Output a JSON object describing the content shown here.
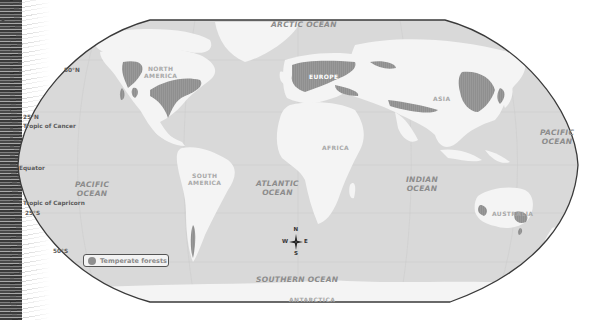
{
  "map": {
    "projection": "Robinson-style world map",
    "colors": {
      "ocean": "#d9d9d9",
      "land": "#f4f4f4",
      "forest": "#8f8f8f",
      "border": "#3a3a3a",
      "graticule": "#c8c8c8"
    },
    "oceans": {
      "arctic": "ARCTIC OCEAN",
      "pacific_west": [
        "PACIFIC",
        "OCEAN"
      ],
      "pacific_east": [
        "PACIFIC",
        "OCEAN"
      ],
      "atlantic": [
        "ATLANTIC",
        "OCEAN"
      ],
      "indian": [
        "INDIAN",
        "OCEAN"
      ],
      "southern": "SOUTHERN OCEAN"
    },
    "continents": {
      "north_america": [
        "NORTH",
        "AMERICA"
      ],
      "south_america": [
        "SOUTH",
        "AMERICA"
      ],
      "europe": "EUROPE",
      "africa": "AFRICA",
      "asia": "ASIA",
      "australia": "AUSTRALIA",
      "antarctica": "ANTARCTICA"
    },
    "latitudes": {
      "n50": "50°N",
      "n25": "25°N",
      "cancer": "Tropic of Cancer",
      "equator": "Equator",
      "capricorn": "Tropic of Capricorn",
      "s25": "25°S",
      "s50": "50°S"
    },
    "compass": {
      "n": "N",
      "s": "S",
      "e": "E",
      "w": "W"
    },
    "legend": {
      "label": "Temperate forests",
      "swatch_color": "#8f8f8f"
    }
  }
}
